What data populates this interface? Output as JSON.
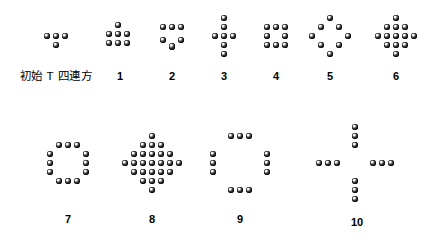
{
  "figure": {
    "background_color": "#ffffff",
    "dot_color": "#000000",
    "width": 443,
    "height": 243,
    "dot_radius": 3.4,
    "grid_step": 9.0
  },
  "panels": [
    {
      "id": "panel-initial",
      "label": "初始 T 四連方",
      "label_kind": "cjk",
      "step": 0,
      "dot_count": 4,
      "center_x": 56,
      "center_y": 36,
      "label_x": 56,
      "label_y": 70,
      "shape": "T-tetromino",
      "cells": [
        [
          -1,
          0
        ],
        [
          0,
          0
        ],
        [
          1,
          0
        ],
        [
          0,
          1
        ]
      ]
    },
    {
      "id": "panel-1",
      "label": "1",
      "label_kind": "number",
      "step": 1,
      "dot_count": 7,
      "center_x": 118,
      "center_y": 34,
      "label_x": 120,
      "label_y": 70,
      "shape": "one-on-top-of-3x2-block",
      "cells": [
        [
          0,
          -1
        ],
        [
          -1,
          0
        ],
        [
          0,
          0
        ],
        [
          1,
          0
        ],
        [
          -1,
          1
        ],
        [
          0,
          1
        ],
        [
          1,
          1
        ]
      ]
    },
    {
      "id": "panel-2",
      "label": "2",
      "label_kind": "number",
      "step": 2,
      "dot_count": 6,
      "center_x": 172,
      "center_y": 36,
      "label_x": 172,
      "label_y": 70,
      "shape": "row-of-3-over-V",
      "cells": [
        [
          -1,
          -1
        ],
        [
          0,
          -1
        ],
        [
          1,
          -1
        ],
        [
          -1,
          0.45
        ],
        [
          1,
          0.45
        ],
        [
          0,
          1.2
        ]
      ]
    },
    {
      "id": "panel-3",
      "label": "3",
      "label_kind": "number",
      "step": 3,
      "dot_count": 7,
      "center_x": 224,
      "center_y": 36,
      "label_x": 224,
      "label_y": 70,
      "shape": "tall-cross",
      "cells": [
        [
          0,
          -2
        ],
        [
          0,
          -1
        ],
        [
          -1,
          0
        ],
        [
          0,
          0
        ],
        [
          1,
          0
        ],
        [
          0,
          1
        ],
        [
          0,
          2
        ]
      ]
    },
    {
      "id": "panel-4",
      "label": "4",
      "label_kind": "number",
      "step": 4,
      "dot_count": 8,
      "center_x": 276,
      "center_y": 36,
      "label_x": 276,
      "label_y": 70,
      "shape": "3x3-ring",
      "cells": [
        [
          -1,
          -1
        ],
        [
          0,
          -1
        ],
        [
          1,
          -1
        ],
        [
          -1,
          0
        ],
        [
          1,
          0
        ],
        [
          -1,
          1
        ],
        [
          0,
          1
        ],
        [
          1,
          1
        ]
      ]
    },
    {
      "id": "panel-5",
      "label": "5",
      "label_kind": "number",
      "step": 5,
      "dot_count": 8,
      "center_x": 330,
      "center_y": 36,
      "label_x": 330,
      "label_y": 70,
      "shape": "diamond-ring",
      "cells": [
        [
          0,
          -2
        ],
        [
          -1,
          -1
        ],
        [
          1,
          -1
        ],
        [
          -2,
          0
        ],
        [
          2,
          0
        ],
        [
          -1,
          1
        ],
        [
          1,
          1
        ],
        [
          0,
          2
        ]
      ]
    },
    {
      "id": "panel-6",
      "label": "6",
      "label_kind": "number",
      "step": 6,
      "dot_count": 13,
      "center_x": 396,
      "center_y": 36,
      "label_x": 396,
      "label_y": 70,
      "shape": "filled-diamond",
      "cells": [
        [
          0,
          -2
        ],
        [
          -1,
          -1
        ],
        [
          0,
          -1
        ],
        [
          1,
          -1
        ],
        [
          -2,
          0
        ],
        [
          -1,
          0
        ],
        [
          0,
          0
        ],
        [
          1,
          0
        ],
        [
          2,
          0
        ],
        [
          -1,
          1
        ],
        [
          0,
          1
        ],
        [
          1,
          1
        ],
        [
          0,
          2
        ]
      ]
    },
    {
      "id": "panel-7",
      "label": "7",
      "label_kind": "number",
      "step": 7,
      "dot_count": 12,
      "center_x": 68,
      "center_y": 163,
      "label_x": 68,
      "label_y": 213,
      "shape": "square-ring-cut-corners",
      "cells": [
        [
          -1,
          -2
        ],
        [
          0,
          -2
        ],
        [
          1,
          -2
        ],
        [
          -2,
          -1
        ],
        [
          2,
          -1
        ],
        [
          -2,
          0
        ],
        [
          2,
          0
        ],
        [
          -2,
          1
        ],
        [
          2,
          1
        ],
        [
          -1,
          2
        ],
        [
          0,
          2
        ],
        [
          1,
          2
        ]
      ]
    },
    {
      "id": "panel-8",
      "label": "8",
      "label_kind": "number",
      "step": 8,
      "dot_count": 25,
      "center_x": 152,
      "center_y": 163,
      "label_x": 152,
      "label_y": 213,
      "shape": "large-filled-diamond",
      "cells": [
        [
          0,
          -3
        ],
        [
          -1,
          -2
        ],
        [
          0,
          -2
        ],
        [
          1,
          -2
        ],
        [
          -2,
          -1
        ],
        [
          -1,
          -1
        ],
        [
          0,
          -1
        ],
        [
          1,
          -1
        ],
        [
          2,
          -1
        ],
        [
          -3,
          0
        ],
        [
          -2,
          0
        ],
        [
          -1,
          0
        ],
        [
          0,
          0
        ],
        [
          1,
          0
        ],
        [
          2,
          0
        ],
        [
          3,
          0
        ],
        [
          -2,
          1
        ],
        [
          -1,
          1
        ],
        [
          0,
          1
        ],
        [
          1,
          1
        ],
        [
          2,
          1
        ],
        [
          -1,
          2
        ],
        [
          0,
          2
        ],
        [
          1,
          2
        ],
        [
          0,
          3
        ]
      ]
    },
    {
      "id": "panel-9",
      "label": "9",
      "label_kind": "number",
      "step": 9,
      "dot_count": 12,
      "center_x": 240,
      "center_y": 163,
      "label_x": 240,
      "label_y": 213,
      "shape": "wide-ring-cut-corners",
      "cells": [
        [
          -1,
          -3
        ],
        [
          0,
          -3
        ],
        [
          1,
          -3
        ],
        [
          -3,
          -1
        ],
        [
          -3,
          0
        ],
        [
          -3,
          1
        ],
        [
          3,
          -1
        ],
        [
          3,
          0
        ],
        [
          3,
          1
        ],
        [
          -1,
          3
        ],
        [
          0,
          3
        ],
        [
          1,
          3
        ]
      ]
    },
    {
      "id": "panel-10",
      "label": "10",
      "label_kind": "number",
      "step": 10,
      "dot_count": 12,
      "center_x": 355,
      "center_y": 163,
      "label_x": 357,
      "label_y": 216,
      "shape": "large-plus-cross",
      "cells": [
        [
          0,
          -4
        ],
        [
          0,
          -3
        ],
        [
          0,
          -2
        ],
        [
          -4,
          0
        ],
        [
          -3,
          0
        ],
        [
          -2,
          0
        ],
        [
          2,
          0
        ],
        [
          3,
          0
        ],
        [
          4,
          0
        ],
        [
          0,
          2
        ],
        [
          0,
          3
        ],
        [
          0,
          4
        ]
      ]
    }
  ]
}
